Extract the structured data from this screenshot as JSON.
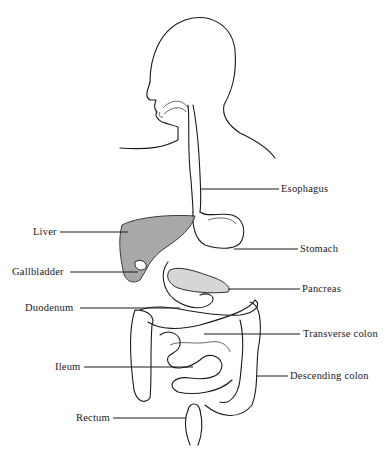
{
  "diagram": {
    "labels": [
      {
        "id": "esophagus",
        "text": "Esophagus",
        "x": 281,
        "y": 183,
        "side": "right",
        "line_from": [
          204,
          189
        ],
        "line_to": [
          279,
          189
        ]
      },
      {
        "id": "liver",
        "text": "Liver",
        "x": 33,
        "y": 226,
        "side": "left",
        "line_from": [
          60,
          232
        ],
        "line_to": [
          128,
          232
        ]
      },
      {
        "id": "stomach",
        "text": "Stomach",
        "x": 300,
        "y": 242,
        "side": "right",
        "line_from": [
          234,
          249
        ],
        "line_to": [
          298,
          249
        ]
      },
      {
        "id": "gallbladder",
        "text": "Gallbladder",
        "x": 12,
        "y": 266,
        "side": "left",
        "line_from": [
          70,
          272
        ],
        "line_to": [
          138,
          272
        ]
      },
      {
        "id": "pancreas",
        "text": "Pancreas",
        "x": 302,
        "y": 283,
        "side": "right",
        "line_from": [
          232,
          289
        ],
        "line_to": [
          300,
          289
        ]
      },
      {
        "id": "duodenum",
        "text": "Duodenum",
        "x": 25,
        "y": 302,
        "side": "left",
        "line_from": [
          80,
          308
        ],
        "line_to": [
          180,
          308
        ]
      },
      {
        "id": "transverse-colon",
        "text": "Transverse colon",
        "x": 303,
        "y": 328,
        "side": "right",
        "line_from": [
          204,
          334
        ],
        "line_to": [
          300,
          334
        ]
      },
      {
        "id": "ileum",
        "text": "Ileum",
        "x": 55,
        "y": 361,
        "side": "left",
        "line_from": [
          84,
          367
        ],
        "line_to": [
          193,
          367
        ]
      },
      {
        "id": "descending-colon",
        "text": "Descending colon",
        "x": 290,
        "y": 370,
        "side": "right",
        "line_from": [
          256,
          376
        ],
        "line_to": [
          288,
          376
        ]
      },
      {
        "id": "rectum",
        "text": "Rectum",
        "x": 76,
        "y": 412,
        "side": "left",
        "line_from": [
          113,
          418
        ],
        "line_to": [
          186,
          418
        ]
      }
    ]
  }
}
